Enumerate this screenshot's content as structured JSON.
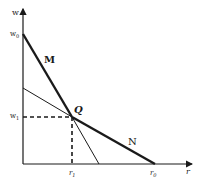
{
  "diagram": {
    "axes": {
      "y_label": "w",
      "x_label": "r"
    },
    "y_ticks": [
      {
        "label": "w",
        "sub": "0"
      },
      {
        "label": "w",
        "sub": "1"
      }
    ],
    "x_ticks": [
      {
        "label": "r",
        "sub": "1"
      },
      {
        "label": "r",
        "sub": "0"
      }
    ],
    "curves": [
      {
        "label": "M",
        "weight": "thick"
      },
      {
        "label": "N",
        "weight": "thick"
      }
    ],
    "point": {
      "label": "Q"
    },
    "colors": {
      "ink": "#1a1a1a",
      "background": "#ffffff"
    }
  }
}
